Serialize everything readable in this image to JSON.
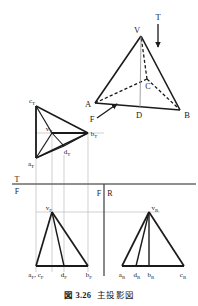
{
  "figure": {
    "caption_number": "図 3.26",
    "caption_title": "主投影図",
    "background_color": "#ffffff",
    "ink_color": "#1a1a1a",
    "projection_line_color": "#b4b4b4"
  },
  "pictorial_view": {
    "name": "isometric-tetrahedron",
    "vertices": [
      {
        "id": "V",
        "label": "V",
        "x": 141,
        "y": 32
      },
      {
        "id": "A",
        "label": "A",
        "x": 93,
        "y": 104
      },
      {
        "id": "B",
        "label": "B",
        "x": 182,
        "y": 115
      },
      {
        "id": "C",
        "label": "C",
        "x": 141,
        "y": 84
      },
      {
        "id": "D",
        "label": "D",
        "x": 140,
        "y": 112
      }
    ],
    "direction_arrows": [
      {
        "id": "T",
        "label": "T",
        "description": "top-view-direction-arrow",
        "x": 156,
        "y": 16
      },
      {
        "id": "F",
        "label": "F",
        "description": "front-view-direction-arrow",
        "x": 94,
        "y": 116
      }
    ]
  },
  "top_view": {
    "name": "top-view",
    "labels": [
      {
        "id": "c_T",
        "base": "c",
        "sub": "T"
      },
      {
        "id": "v_T",
        "base": "v",
        "sub": "T"
      },
      {
        "id": "b_T",
        "base": "b",
        "sub": "T"
      },
      {
        "id": "a_T",
        "base": "a",
        "sub": "T"
      },
      {
        "id": "d_T",
        "base": "d",
        "sub": "T"
      }
    ]
  },
  "front_view": {
    "name": "front-view",
    "apex_label": {
      "base": "v",
      "sub": "F"
    },
    "baseline_labels": [
      {
        "id": "af_cf",
        "text": "a",
        "sub": "F",
        "text2": ", c",
        "sub2": "F"
      },
      {
        "id": "df",
        "text": "d",
        "sub": "F"
      },
      {
        "id": "bf",
        "text": "b",
        "sub": "F"
      }
    ]
  },
  "side_view": {
    "name": "right-side-view",
    "apex_label": {
      "base": "v",
      "sub": "R"
    },
    "baseline_labels": [
      {
        "id": "ar",
        "text": "a",
        "sub": "R"
      },
      {
        "id": "dr",
        "text": "d",
        "sub": "R"
      },
      {
        "id": "br",
        "text": "b",
        "sub": "R"
      },
      {
        "id": "cr",
        "text": "c",
        "sub": "R"
      }
    ]
  },
  "reference_lines": {
    "horizontal": {
      "name": "tf-fold-line",
      "label_top": "T",
      "label_bottom": "F",
      "y": 184
    },
    "vertical": {
      "name": "fr-fold-line",
      "label_left": "F",
      "label_right": "R",
      "x": 104
    }
  }
}
